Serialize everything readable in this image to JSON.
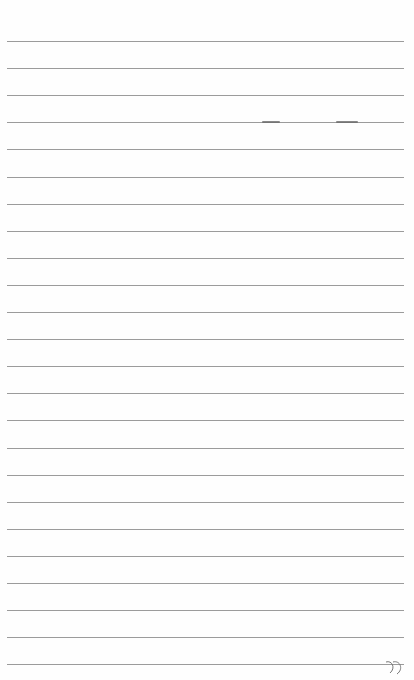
{
  "paper": {
    "line_count": 24,
    "first_line_y": 41,
    "line_spacing": 27.1,
    "line_color": "#8a8a8a",
    "background": "#fefefe"
  },
  "marks": [
    {
      "type": "smudge",
      "x": 262,
      "y": 121,
      "w": 18
    },
    {
      "type": "smudge",
      "x": 336,
      "y": 121,
      "w": 22
    }
  ]
}
